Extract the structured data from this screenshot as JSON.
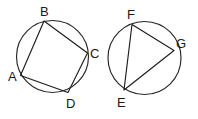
{
  "figure": {
    "background_color": "#ffffff",
    "stroke_color": "#262626",
    "label_color": "#1a1a1a",
    "width": 198,
    "height": 119,
    "shapes": [
      {
        "id": "left-circle",
        "name": "circle-with-inscribed-quadrilateral",
        "circle": {
          "cx": 52.5,
          "cy": 56.5,
          "r": 36.0
        },
        "polygon_type": "quadrilateral",
        "polygon_points": "44,21 87.5,53 68,92.5 20.5,75.5",
        "vertices": [
          {
            "key": "B",
            "label": "B",
            "x": 44.0,
            "y": 21.0,
            "label_x": 40.0,
            "label_y": 16.0
          },
          {
            "key": "C",
            "label": "C",
            "x": 87.5,
            "y": 53.0,
            "label_x": 90.0,
            "label_y": 58.0
          },
          {
            "key": "D",
            "label": "D",
            "x": 68.0,
            "y": 92.5,
            "label_x": 66.0,
            "label_y": 108.0
          },
          {
            "key": "A",
            "label": "A",
            "x": 20.5,
            "y": 75.5,
            "label_x": 8.0,
            "label_y": 81.0
          }
        ]
      },
      {
        "id": "right-circle",
        "name": "circle-with-inscribed-triangle",
        "circle": {
          "cx": 144.5,
          "cy": 58.0,
          "r": 36.5
        },
        "polygon_type": "triangle",
        "polygon_points": "132,24.5 174,50.5 124,90",
        "vertices": [
          {
            "key": "F",
            "label": "F",
            "x": 132.0,
            "y": 24.5,
            "label_x": 127.0,
            "label_y": 19.0
          },
          {
            "key": "G",
            "label": "G",
            "x": 174.0,
            "y": 50.5,
            "label_x": 176.0,
            "label_y": 48.0
          },
          {
            "key": "E",
            "label": "E",
            "x": 124.0,
            "y": 90.0,
            "label_x": 117.0,
            "label_y": 107.0
          }
        ]
      }
    ]
  }
}
